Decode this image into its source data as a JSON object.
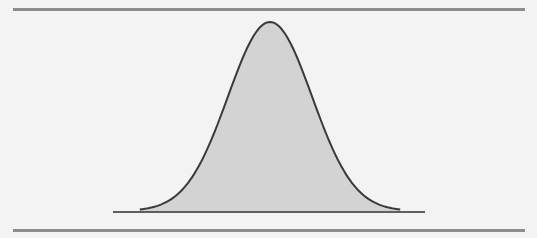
{
  "figure": {
    "colors": {
      "background": "#f3f3f3",
      "fill": "#d3d3d3",
      "curve": "#3a3a3a",
      "baseline": "#2e2e2e",
      "rules": "#8c8c8c"
    }
  },
  "chart_data": {
    "type": "area",
    "title": "",
    "xlabel": "",
    "ylabel": "",
    "distribution": "normal",
    "mean": 0,
    "std": 1,
    "x_range": [
      -3.1,
      3.1
    ],
    "grid": false,
    "legend": null,
    "series": [
      {
        "name": "normal density",
        "x": [
          -3,
          -2.5,
          -2,
          -1.5,
          -1,
          -0.5,
          0,
          0.5,
          1,
          1.5,
          2,
          2.5,
          3
        ],
        "values": [
          0.004,
          0.018,
          0.054,
          0.13,
          0.242,
          0.352,
          0.399,
          0.352,
          0.242,
          0.13,
          0.054,
          0.018,
          0.004
        ]
      }
    ],
    "shaded_region": "entire area under curve"
  }
}
